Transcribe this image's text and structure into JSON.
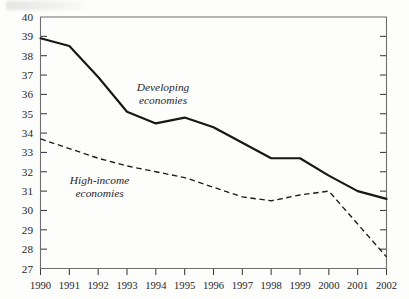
{
  "chart_data": {
    "type": "line",
    "title": "",
    "subtitle": "",
    "xlabel": "",
    "ylabel": "",
    "grid": false,
    "legend_position": "inline-annotation",
    "x": [
      1990,
      1991,
      1992,
      1993,
      1994,
      1995,
      1996,
      1997,
      1998,
      1999,
      2000,
      2001,
      2002
    ],
    "categories": [
      "1990",
      "1991",
      "1992",
      "1993",
      "1994",
      "1995",
      "1996",
      "1997",
      "1998",
      "1999",
      "2000",
      "2001",
      "2002"
    ],
    "xlim": [
      1990,
      2002
    ],
    "ylim": [
      27,
      40
    ],
    "ytick_labels": [
      "40",
      "39",
      "38",
      "37",
      "36",
      "35",
      "34",
      "33",
      "32",
      "31",
      "30",
      "29",
      "28",
      "27"
    ],
    "ytick_values": [
      40,
      39,
      38,
      37,
      36,
      35,
      34,
      33,
      32,
      31,
      30,
      29,
      28,
      27
    ],
    "series": [
      {
        "name": "Developing economies",
        "style": "solid",
        "color": "#171717",
        "label_x": 1994.25,
        "label_y": 36.15,
        "values": [
          38.9,
          38.5,
          36.9,
          35.1,
          34.5,
          34.8,
          34.3,
          33.5,
          32.7,
          32.7,
          31.8,
          31.0,
          30.6
        ]
      },
      {
        "name": "High-income economies",
        "style": "dashed",
        "color": "#1c1c1c",
        "label_x": 1992.05,
        "label_y": 31.35,
        "values": [
          33.7,
          33.2,
          32.7,
          32.3,
          32.0,
          31.7,
          31.2,
          30.7,
          30.5,
          30.8,
          31.0,
          29.3,
          27.6
        ]
      }
    ]
  }
}
